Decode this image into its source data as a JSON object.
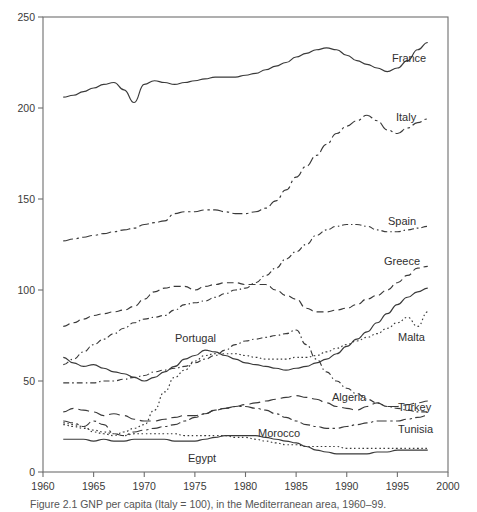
{
  "figure": {
    "caption": "Figure 2.1  GNP per capita (Italy = 100), in the Mediterranean area, 1960–99.",
    "background": "#ffffff",
    "line_color": "#3a3a3a"
  },
  "chart_data": {
    "type": "line",
    "title": "",
    "xlabel": "",
    "ylabel": "",
    "xlim": [
      1960,
      2000
    ],
    "ylim": [
      0,
      250
    ],
    "xticks": [
      1960,
      1965,
      1970,
      1975,
      1980,
      1985,
      1990,
      1995,
      2000
    ],
    "yticks": [
      0,
      50,
      100,
      150,
      200,
      250
    ],
    "grid": false,
    "legend_position": "inline-right",
    "x": [
      1962,
      1963,
      1964,
      1965,
      1966,
      1967,
      1968,
      1969,
      1970,
      1971,
      1972,
      1973,
      1974,
      1975,
      1976,
      1977,
      1978,
      1979,
      1980,
      1981,
      1982,
      1983,
      1984,
      1985,
      1986,
      1987,
      1988,
      1989,
      1990,
      1991,
      1992,
      1993,
      1994,
      1995,
      1996,
      1997,
      1998
    ],
    "series": [
      {
        "name": "France",
        "label": "France",
        "style": "solid",
        "values": [
          206,
          207,
          209,
          211,
          213,
          214,
          210,
          203,
          213,
          215,
          214,
          213,
          214,
          215,
          216,
          217,
          217,
          217,
          218,
          219,
          221,
          223,
          225,
          228,
          230,
          232,
          233,
          232,
          229,
          226,
          224,
          222,
          220,
          222,
          226,
          232,
          236
        ]
      },
      {
        "name": "Italy",
        "label": "Italy",
        "style": "dashdot",
        "values": [
          127,
          128,
          129,
          130,
          131,
          132,
          133,
          134,
          136,
          137,
          138,
          142,
          143,
          143,
          144,
          144,
          143,
          142,
          142,
          143,
          145,
          149,
          155,
          162,
          168,
          174,
          180,
          186,
          190,
          193,
          196,
          193,
          188,
          186,
          189,
          192,
          194
        ]
      },
      {
        "name": "Spain",
        "label": "Spain",
        "style": "finedashdot",
        "values": [
          59,
          62,
          66,
          70,
          73,
          76,
          79,
          82,
          84,
          85,
          86,
          89,
          92,
          93,
          94,
          96,
          98,
          100,
          101,
          104,
          108,
          112,
          117,
          121,
          125,
          130,
          133,
          135,
          136,
          136,
          135,
          133,
          132,
          132,
          133,
          134,
          135
        ]
      },
      {
        "name": "Greece",
        "label": "Greece",
        "style": "dashed",
        "values": [
          80,
          82,
          84,
          86,
          87,
          88,
          89,
          91,
          95,
          99,
          101,
          102,
          102,
          100,
          102,
          103,
          104,
          104,
          103,
          103,
          103,
          100,
          97,
          95,
          90,
          88,
          88,
          89,
          90,
          92,
          95,
          97,
          100,
          104,
          108,
          112,
          113
        ]
      },
      {
        "name": "Malta",
        "label": "Malta",
        "style": "dotted",
        "values": [
          27,
          26,
          25,
          22,
          21,
          20,
          22,
          24,
          26,
          34,
          44,
          52,
          56,
          61,
          64,
          65,
          65,
          65,
          64,
          63,
          62,
          62,
          62,
          63,
          63,
          64,
          66,
          68,
          70,
          72,
          74,
          76,
          79,
          82,
          85,
          80,
          88
        ]
      },
      {
        "name": "Portugal",
        "label": "Portugal",
        "style": "solid",
        "values": [
          63,
          60,
          58,
          59,
          57,
          55,
          54,
          52,
          50,
          52,
          55,
          58,
          62,
          64,
          67,
          66,
          64,
          62,
          60,
          59,
          58,
          57,
          56,
          57,
          58,
          60,
          62,
          65,
          69,
          73,
          77,
          82,
          87,
          92,
          96,
          99,
          101
        ]
      },
      {
        "name": "Algeria",
        "label": "Algeria",
        "style": "finedashdot",
        "values": [
          49,
          49,
          49,
          49,
          50,
          50,
          51,
          52,
          53,
          55,
          56,
          57,
          58,
          60,
          62,
          64,
          67,
          70,
          72,
          73,
          74,
          75,
          76,
          78,
          70,
          62,
          55,
          50,
          46,
          43,
          40,
          38,
          36,
          35,
          34,
          33,
          33
        ]
      },
      {
        "name": "Turkey",
        "label": "Turkey",
        "style": "longdash",
        "values": [
          33,
          35,
          34,
          33,
          31,
          32,
          31,
          29,
          28,
          28,
          29,
          30,
          31,
          31,
          32,
          34,
          35,
          36,
          37,
          38,
          39,
          40,
          41,
          42,
          41,
          40,
          38,
          36,
          35,
          34,
          36,
          38,
          36,
          36,
          37,
          38,
          39
        ]
      },
      {
        "name": "Tunisia",
        "label": "Tunisia",
        "style": "dashdot",
        "values": [
          28,
          27,
          25,
          28,
          26,
          21,
          20,
          22,
          23,
          24,
          25,
          26,
          28,
          30,
          32,
          34,
          35,
          36,
          36,
          35,
          34,
          32,
          30,
          28,
          26,
          25,
          24,
          24,
          25,
          26,
          27,
          28,
          28,
          28,
          29,
          30,
          31
        ]
      },
      {
        "name": "Morocco",
        "label": "Morocco",
        "style": "dotted",
        "values": [
          26,
          25,
          24,
          23,
          22,
          21,
          20,
          21,
          21,
          21,
          21,
          21,
          20,
          20,
          20,
          20,
          20,
          19,
          19,
          18,
          17,
          16,
          15,
          15,
          14,
          14,
          14,
          14,
          13,
          13,
          13,
          13,
          13,
          13,
          13,
          13,
          13
        ]
      },
      {
        "name": "Egypt",
        "label": "Egypt",
        "style": "solid",
        "values": [
          18,
          18,
          18,
          17,
          18,
          17,
          17,
          18,
          18,
          18,
          18,
          17,
          17,
          17,
          18,
          19,
          20,
          20,
          20,
          20,
          19,
          18,
          17,
          16,
          14,
          12,
          11,
          10,
          10,
          10,
          10,
          11,
          11,
          12,
          12,
          12,
          12
        ]
      }
    ],
    "inline_labels": [
      {
        "text": "France",
        "x": 392,
        "y": 62,
        "anchor": "start"
      },
      {
        "text": "Italy",
        "x": 396,
        "y": 121,
        "anchor": "start"
      },
      {
        "text": "Spain",
        "x": 388,
        "y": 225,
        "anchor": "start"
      },
      {
        "text": "Greece",
        "x": 384,
        "y": 265,
        "anchor": "start"
      },
      {
        "text": "Malta",
        "x": 398,
        "y": 341,
        "anchor": "start"
      },
      {
        "text": "Turkey",
        "x": 398,
        "y": 411,
        "anchor": "start"
      },
      {
        "text": "Tunisia",
        "x": 398,
        "y": 433,
        "anchor": "start"
      },
      {
        "text": "Portugal",
        "x": 175,
        "y": 342,
        "anchor": "start"
      },
      {
        "text": "Algeria",
        "x": 332,
        "y": 401,
        "anchor": "start"
      },
      {
        "text": "Morocco",
        "x": 258,
        "y": 437,
        "anchor": "start"
      },
      {
        "text": "Egypt",
        "x": 188,
        "y": 462,
        "anchor": "start"
      }
    ]
  }
}
